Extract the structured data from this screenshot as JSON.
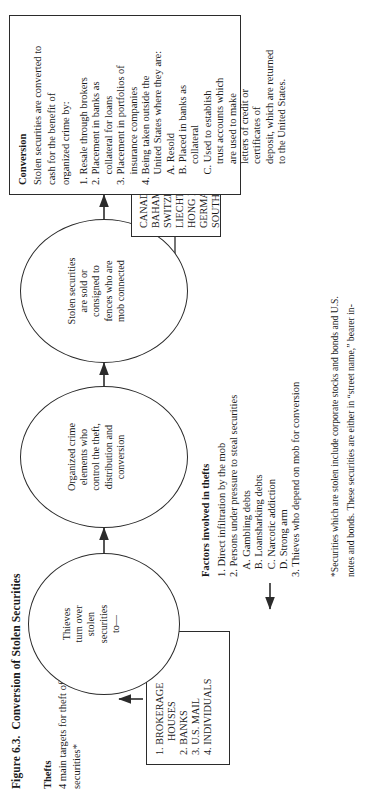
{
  "figure": {
    "number": "Figure 6.3.",
    "title": "Conversion of Stolen Securities"
  },
  "thefts": {
    "heading": "Thefts",
    "subtitle_line1": "4 main targets for theft of",
    "subtitle_line2": "securities*",
    "targets": [
      {
        "num": "1.",
        "label_line1": "BROKERAGE",
        "label_line2": "HOUSES"
      },
      {
        "num": "2.",
        "label_line1": "BANKS",
        "label_line2": ""
      },
      {
        "num": "3.",
        "label_line1": "U.S. MAIL",
        "label_line2": ""
      },
      {
        "num": "4.",
        "label_line1": "INDIVIDUALS",
        "label_line2": ""
      }
    ]
  },
  "factors": {
    "heading": "Factors involved in thefts",
    "items": [
      "1. Direct infiltration by the mob",
      "2. Persons under pressure to steal securities",
      "   A. Gambling debts",
      "   B. Loansharking debts",
      "   C. Narcotic addiction",
      "   D. Strong arm",
      "3. Thieves who depend on mob for conversion"
    ]
  },
  "flow": {
    "stage1": {
      "lines": [
        "Thieves",
        "turn over",
        "stolen",
        "securities",
        "to—"
      ]
    },
    "stage2": {
      "lines": [
        "Organized crime",
        "elements who",
        "control the theft,",
        "distribution and",
        "conversion"
      ]
    },
    "stage3": {
      "lines": [
        "Stolen securities",
        "are sold or",
        "consigned to",
        "fences who are",
        "mob connected"
      ]
    }
  },
  "countries": {
    "items": [
      "CANADA",
      "BAHAMAS",
      "SWITZERLAND",
      "LIECHTENSTEIN",
      "HONG KONG",
      "GERMANY",
      "SOUTH AMERICA"
    ]
  },
  "conversion": {
    "heading": "Conversion",
    "intro_line1": "Stolen securities are converted to",
    "intro_line2": "cash for the benefit of",
    "intro_line3": "organized crime by:",
    "items": [
      "1. Resale through brokers",
      "2. Placement in banks as",
      "    collateral for loans",
      "3. Placement in portfolios of",
      "    insurance companies",
      "4. Being taken outside the",
      "    United States where they are:",
      "    A. Resold",
      "    B. Placed in banks as",
      "        collateral",
      "    C. Used to establish",
      "        trust accounts which",
      "        are used to make",
      "        letters of credit or",
      "        certificates of",
      "        deposit, which are returned",
      "        to the United States."
    ]
  },
  "footnote": {
    "line1": "*Securities which are stolen include corporate stocks and bonds and U.S.",
    "line2": "notes and bonds. These securities are either in “street name,” bearer in-"
  }
}
